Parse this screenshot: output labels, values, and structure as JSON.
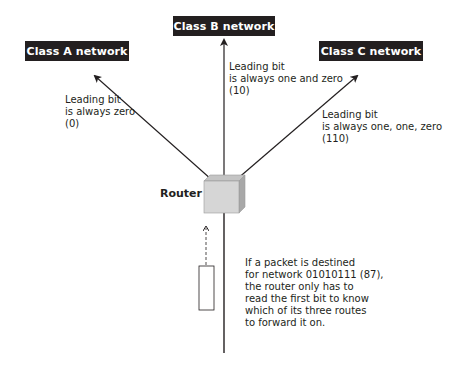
{
  "networks": {
    "a": {
      "label": "Class A network",
      "note": [
        "Leading bit",
        "is always zero",
        "(0)"
      ]
    },
    "b": {
      "label": "Class B network",
      "note": [
        "Leading bit",
        "is always one and zero",
        "(10)"
      ]
    },
    "c": {
      "label": "Class C network",
      "note": [
        "Leading bit",
        "is always one, one, zero",
        "(110)"
      ]
    }
  },
  "router": {
    "label": "Router"
  },
  "packet_note": [
    "If a packet is destined",
    "for network 01010111 (87),",
    "the router only has to",
    "read the first bit to know",
    "which of its three routes",
    "to forward it on."
  ],
  "colors": {
    "box": "#231f20",
    "cube_front": "#d6d6d6",
    "cube_top": "#c4c4c4",
    "cube_side": "#a8a8a8",
    "line": "#231f20"
  }
}
